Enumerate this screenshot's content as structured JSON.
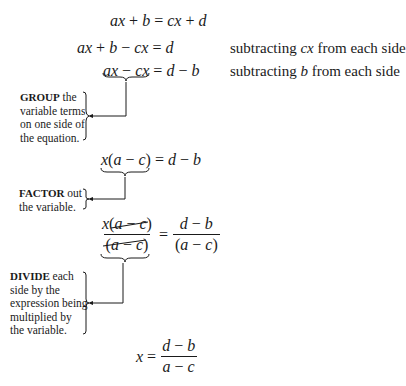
{
  "equations": {
    "line1": "ax + b = cx + d",
    "line2": "ax + b − cx = d",
    "line3": "ax − cx = d − b",
    "line4": "x(a − c) = d − b",
    "line5_num_left": "x(a − c)",
    "line5_den_left": "(a − c)",
    "line5_equals": "=",
    "line5_num_right": "d − b",
    "line5_den_right": "(a − c)",
    "line6_lhs": "x =",
    "line6_num": "d − b",
    "line6_den": "a − c"
  },
  "notes": {
    "note1_pre": "subtracting ",
    "note1_var": "cx",
    "note1_post": " from each side",
    "note2_pre": "subtracting ",
    "note2_var": "b",
    "note2_post": " from each side"
  },
  "labels": {
    "group_keyword": "GROUP",
    "group_rest": " the variable terms on one side of the equation.",
    "factor_keyword": "FACTOR",
    "factor_rest": " out the variable.",
    "divide_keyword": "DIVIDE",
    "divide_rest": " each side by the expression being multiplied by the variable."
  }
}
